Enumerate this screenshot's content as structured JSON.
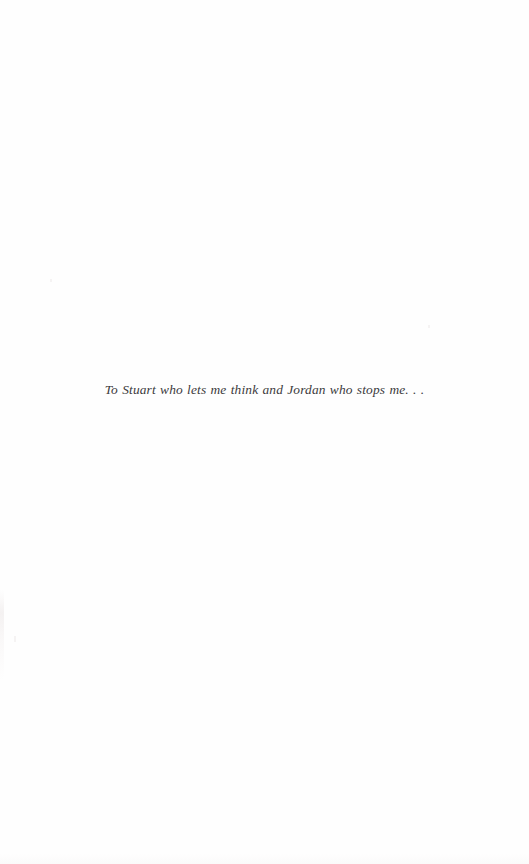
{
  "page": {
    "kind": "book-dedication-page",
    "background_color": "#fefefe",
    "ink_color": "#3b3a3c"
  },
  "dedication": {
    "text": "To Stuart who lets me think and Jordan who stops me. . ."
  }
}
